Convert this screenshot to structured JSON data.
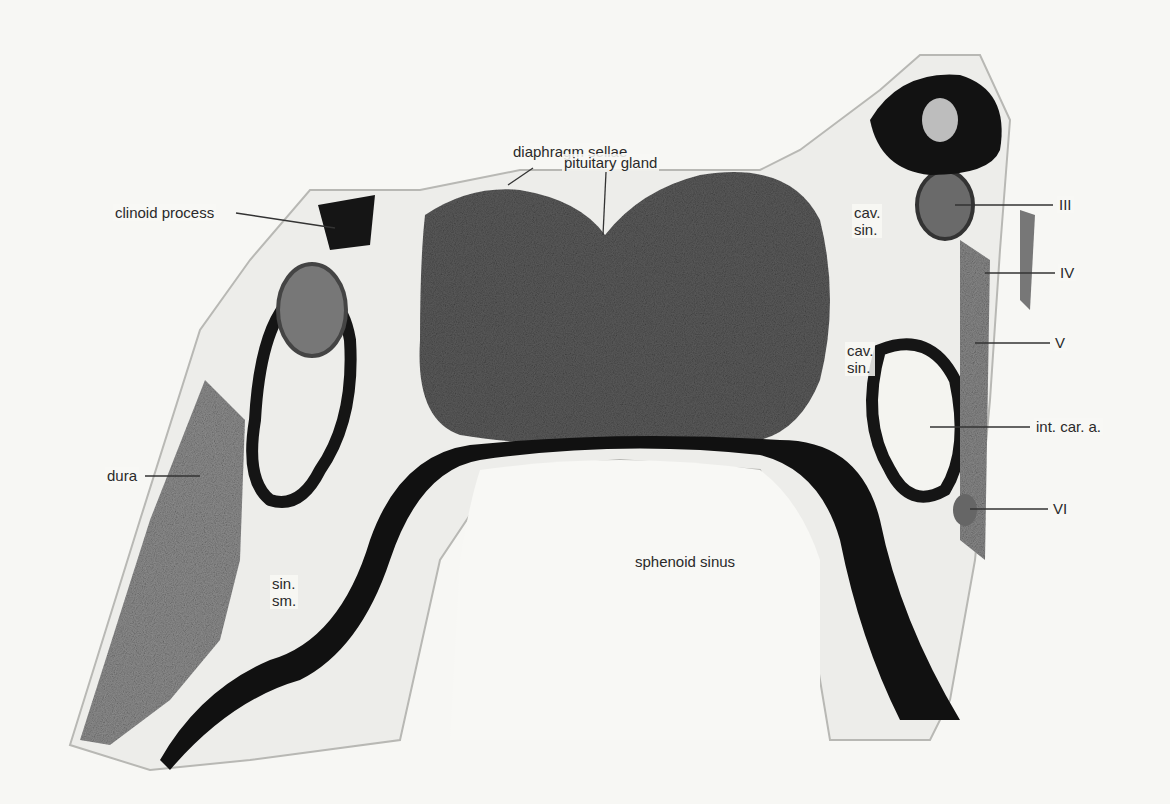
{
  "figure": {
    "labels": {
      "clinoid_process": "clinoid process",
      "diaphragm_sellae": "diaphragm sellae",
      "pituitary_gland": "pituitary gland",
      "cav_sin_upper": "cav.\nsin.",
      "cav_sin_lower": "cav.\nsin.",
      "nerve_III": "III",
      "nerve_IV": "IV",
      "nerve_V": "V",
      "int_car_a": "int. car. a.",
      "nerve_VI": "VI",
      "dura": "dura",
      "sin_sm": "sin.\nsm.",
      "sphenoid_sinus": "sphenoid sinus"
    },
    "colors": {
      "background": "#f7f7f4",
      "gland": "#5e5e5e",
      "bone": "#111111",
      "soft_tissue": "#9a9a9a",
      "label_text": "#2a2a2a"
    }
  }
}
